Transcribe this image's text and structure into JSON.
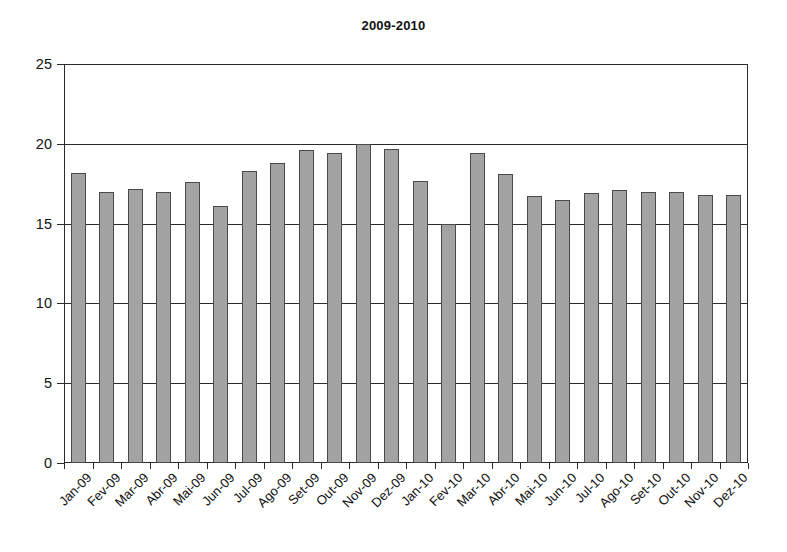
{
  "chart_data": {
    "type": "bar",
    "title": "2009-2010",
    "xlabel": "",
    "ylabel": "",
    "ylim": [
      0,
      25
    ],
    "yticks": [
      0,
      5,
      10,
      15,
      20,
      25
    ],
    "grid": true,
    "legend": "none",
    "categories": [
      "Jan-09",
      "Fev-09",
      "Mar-09",
      "Abr-09",
      "Mai-09",
      "Jun-09",
      "Jul-09",
      "Ago-09",
      "Set-09",
      "Out-09",
      "Nov-09",
      "Dez-09",
      "Jan-10",
      "Fev-10",
      "Mar-10",
      "Abr-10",
      "Mai-10",
      "Jun-10",
      "Jul-10",
      "Ago-10",
      "Set-10",
      "Out-10",
      "Nov-10",
      "Dez-10"
    ],
    "values": [
      18.2,
      17.0,
      17.2,
      17.0,
      17.6,
      16.1,
      18.3,
      18.8,
      19.6,
      19.4,
      20.0,
      19.7,
      17.7,
      15.0,
      19.4,
      18.1,
      16.7,
      16.5,
      16.9,
      17.1,
      17.0,
      17.0,
      16.8,
      16.8
    ],
    "colors": {
      "bar_fill": "#a3a3a3",
      "bar_border": "#4a4a4a",
      "axis": "#2b2b2b",
      "text": "#111111",
      "background": "#ffffff"
    }
  }
}
